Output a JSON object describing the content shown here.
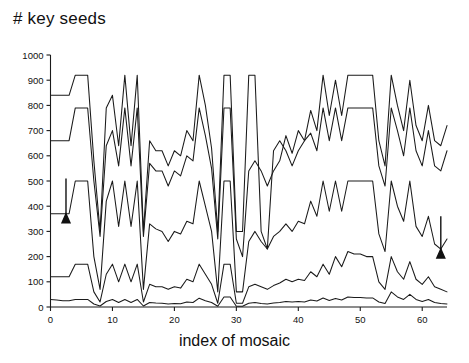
{
  "chart_data": {
    "type": "line",
    "title": "# key seeds",
    "xlabel": "index of mosaic",
    "ylabel": "",
    "xlim": [
      0,
      64
    ],
    "ylim": [
      0,
      1000
    ],
    "grid": false,
    "legend": "none",
    "xticks": [
      0,
      10,
      20,
      30,
      40,
      50,
      60
    ],
    "xtick_labels": [
      "0",
      "10",
      "20",
      "30",
      "40",
      "50",
      "60"
    ],
    "yticks": [
      0,
      100,
      200,
      300,
      400,
      500,
      600,
      700,
      800,
      900,
      1000
    ],
    "ytick_labels": [
      "0",
      "100",
      "200",
      "300",
      "400",
      "500",
      "600",
      "700",
      "800",
      "900",
      "1000"
    ],
    "x": [
      0,
      1,
      2,
      3,
      4,
      5,
      6,
      7,
      8,
      9,
      10,
      11,
      12,
      13,
      14,
      15,
      16,
      17,
      18,
      19,
      20,
      21,
      22,
      23,
      24,
      25,
      26,
      27,
      28,
      29,
      30,
      31,
      32,
      33,
      34,
      35,
      36,
      37,
      38,
      39,
      40,
      41,
      42,
      43,
      44,
      45,
      46,
      47,
      48,
      49,
      50,
      51,
      52,
      53,
      54,
      55,
      56,
      57,
      58,
      59,
      60,
      61,
      62,
      63,
      64
    ],
    "series": [
      {
        "name": "series-1",
        "values": [
          840,
          840,
          840,
          840,
          920,
          920,
          920,
          580,
          300,
          790,
          840,
          640,
          920,
          640,
          920,
          300,
          660,
          620,
          620,
          560,
          620,
          600,
          700,
          660,
          920,
          800,
          630,
          300,
          920,
          920,
          300,
          300,
          920,
          920,
          300,
          230,
          620,
          660,
          620,
          560,
          620,
          660,
          780,
          700,
          920,
          760,
          900,
          760,
          920,
          920,
          920,
          920,
          920,
          660,
          560,
          920,
          800,
          700,
          900,
          720,
          660,
          800,
          660,
          640,
          720
        ]
      },
      {
        "name": "series-2",
        "values": [
          660,
          660,
          660,
          660,
          790,
          790,
          790,
          500,
          280,
          640,
          700,
          560,
          790,
          560,
          790,
          280,
          570,
          540,
          540,
          480,
          540,
          520,
          600,
          580,
          790,
          680,
          550,
          270,
          790,
          790,
          270,
          200,
          540,
          580,
          540,
          480,
          540,
          580,
          680,
          610,
          700,
          660,
          690,
          620,
          790,
          660,
          790,
          660,
          790,
          790,
          790,
          790,
          790,
          560,
          480,
          790,
          700,
          600,
          790,
          620,
          560,
          700,
          560,
          540,
          620
        ]
      },
      {
        "name": "series-3",
        "values": [
          370,
          370,
          370,
          370,
          500,
          500,
          500,
          200,
          70,
          420,
          500,
          320,
          500,
          320,
          500,
          70,
          330,
          310,
          300,
          260,
          300,
          290,
          340,
          330,
          500,
          400,
          300,
          60,
          500,
          500,
          60,
          60,
          260,
          300,
          260,
          230,
          280,
          300,
          330,
          300,
          340,
          330,
          420,
          360,
          500,
          380,
          500,
          380,
          500,
          500,
          500,
          500,
          500,
          290,
          220,
          500,
          400,
          340,
          500,
          320,
          280,
          360,
          250,
          230,
          270
        ]
      },
      {
        "name": "series-4",
        "values": [
          120,
          120,
          120,
          120,
          170,
          170,
          170,
          60,
          20,
          130,
          170,
          100,
          170,
          100,
          170,
          20,
          90,
          80,
          80,
          70,
          80,
          75,
          110,
          100,
          170,
          130,
          90,
          15,
          170,
          170,
          15,
          15,
          80,
          90,
          80,
          70,
          85,
          95,
          110,
          100,
          110,
          105,
          140,
          120,
          170,
          130,
          200,
          160,
          220,
          210,
          210,
          200,
          200,
          100,
          70,
          200,
          140,
          110,
          180,
          110,
          90,
          120,
          80,
          70,
          60
        ]
      },
      {
        "name": "series-5",
        "values": [
          30,
          28,
          25,
          25,
          30,
          30,
          30,
          12,
          4,
          22,
          30,
          18,
          30,
          18,
          30,
          4,
          18,
          16,
          15,
          12,
          14,
          13,
          20,
          18,
          35,
          25,
          18,
          3,
          40,
          40,
          3,
          3,
          15,
          18,
          14,
          12,
          16,
          18,
          22,
          20,
          22,
          20,
          28,
          24,
          36,
          26,
          34,
          28,
          40,
          38,
          38,
          36,
          36,
          20,
          14,
          60,
          40,
          30,
          50,
          30,
          22,
          30,
          18,
          14,
          12
        ]
      }
    ],
    "annotations": [
      {
        "name": "left-arrow",
        "x": 2.5,
        "y_tip": 370,
        "y_tail": 510,
        "direction": "down"
      },
      {
        "name": "right-arrow",
        "x": 63.0,
        "y_tip": 230,
        "y_tail": 360,
        "direction": "down"
      }
    ]
  }
}
